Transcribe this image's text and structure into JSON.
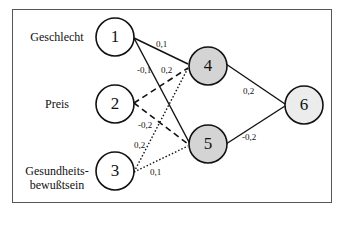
{
  "inputs": [
    {
      "id": "1",
      "label": "Geschlecht"
    },
    {
      "id": "2",
      "label": "Preis"
    },
    {
      "id": "3",
      "label": "Gesundheits-\nbewußtsein",
      "label_line1": "Gesundheits-",
      "label_line2": "bewußtsein"
    }
  ],
  "hidden": [
    {
      "id": "4"
    },
    {
      "id": "5"
    }
  ],
  "output": {
    "id": "6"
  },
  "edges": [
    {
      "from": "1",
      "to": "4",
      "weight": "0,1",
      "style": "solid"
    },
    {
      "from": "1",
      "to": "5",
      "weight": "-0,1",
      "style": "solid"
    },
    {
      "from": "2",
      "to": "4",
      "weight": "0,2",
      "style": "dashed"
    },
    {
      "from": "2",
      "to": "5",
      "weight": "-0,2",
      "style": "dashed"
    },
    {
      "from": "3",
      "to": "4",
      "weight": "0,2",
      "style": "dotted"
    },
    {
      "from": "3",
      "to": "5",
      "weight": "0,1",
      "style": "dotted"
    },
    {
      "from": "4",
      "to": "6",
      "weight": "0,2",
      "style": "solid"
    },
    {
      "from": "5",
      "to": "6",
      "weight": "-0,2",
      "style": "solid"
    }
  ],
  "colors": {
    "hidden_fill": "#d4d4d4",
    "output_fill": "#ececec",
    "input_fill": "#ffffff",
    "stroke": "#111111"
  }
}
